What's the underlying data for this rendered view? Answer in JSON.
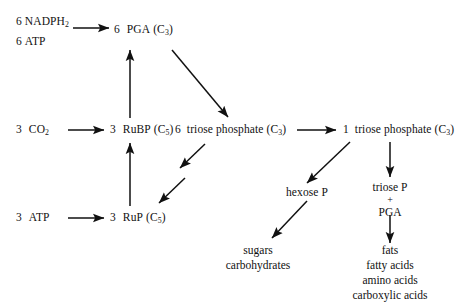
{
  "diagram": {
    "line_color": "#111111",
    "background": "#ffffff",
    "nodes": {
      "nadph": {
        "coef": "6",
        "label": "NADPH",
        "sub": "2"
      },
      "atp_top": {
        "coef": "6",
        "label": "ATP",
        "sub": ""
      },
      "pga": {
        "coef": "6",
        "label": "PGA",
        "carbon": "(C",
        "carbon_sub": "3",
        "carbon_end": ")"
      },
      "co2": {
        "coef": "3",
        "label": "CO",
        "sub": "2"
      },
      "rubp": {
        "coef": "3",
        "label": "RuBP",
        "carbon": "(C",
        "carbon_sub": "5",
        "carbon_end": ")"
      },
      "triose6": {
        "coef": "6",
        "label": "triose phosphate",
        "carbon": "(C",
        "carbon_sub": "3",
        "carbon_end": ")"
      },
      "triose1": {
        "coef": "1",
        "label": "triose phosphate",
        "carbon": "(C",
        "carbon_sub": "3",
        "carbon_end": ")"
      },
      "atp_bottom": {
        "coef": "3",
        "label": "ATP",
        "sub": ""
      },
      "rup": {
        "coef": "3",
        "label": "RuP",
        "carbon": "(C",
        "carbon_sub": "5",
        "carbon_end": ")"
      },
      "hexose": {
        "label": "hexose P"
      },
      "triose_pga": {
        "line1": "triose P",
        "plus": "+",
        "line2": "PGA"
      },
      "sugars": {
        "line1": "sugars",
        "line2": "carbohydrates"
      },
      "fats": {
        "line1": "fats",
        "line2": "fatty acids",
        "line3": "amino acids",
        "line4": "carboxylic acids"
      }
    },
    "arrows": [
      {
        "name": "nadph-atp-to-pga",
        "type": "straight-horizontal"
      },
      {
        "name": "rubp-to-pga",
        "type": "straight-vertical-up"
      },
      {
        "name": "pga-to-triose6",
        "type": "diagonal-down-right"
      },
      {
        "name": "co2-to-rubp",
        "type": "straight-horizontal"
      },
      {
        "name": "triose6-to-triose1",
        "type": "straight-horizontal"
      },
      {
        "name": "triose6-to-rup-step1",
        "type": "diagonal-down-left"
      },
      {
        "name": "triose6-to-rup-step2",
        "type": "diagonal-down-left"
      },
      {
        "name": "atp-to-rup",
        "type": "straight-horizontal"
      },
      {
        "name": "rup-to-rubp",
        "type": "straight-vertical-up"
      },
      {
        "name": "triose1-to-hexose",
        "type": "diagonal-down-left"
      },
      {
        "name": "triose1-to-triose-pga",
        "type": "straight-vertical-down"
      },
      {
        "name": "hexose-to-sugars",
        "type": "diagonal-down-left"
      },
      {
        "name": "triose-pga-to-fats",
        "type": "straight-vertical-down"
      }
    ]
  }
}
